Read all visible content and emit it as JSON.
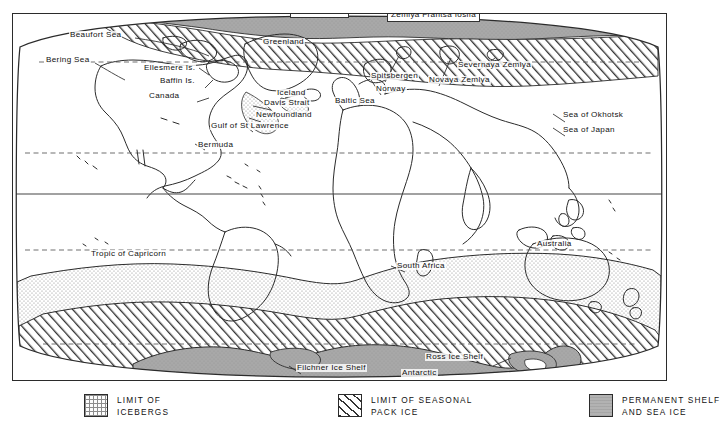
{
  "map": {
    "title": "World map of sea ice and iceberg limits",
    "projection": "oval",
    "colors": {
      "outline": "#2b2b2b",
      "permanent_ice": "#a8a8a8",
      "iceberg_stipple": "#e8e8e8",
      "pack_ice_hatch": "#ffffff",
      "graticule": "#555555"
    },
    "graticule": {
      "equator_label": "",
      "tropic_of_cancer": "",
      "tropic_of_capricorn": "Tropic of Capricorn",
      "arctic_circle": ""
    },
    "labels": [
      {
        "id": "arctic-ocean",
        "text": "Arctic Ocean",
        "x": 289,
        "y": 4,
        "style": "boxed"
      },
      {
        "id": "zemlya-frantsa-iosifa",
        "text": "Zemlya Frantsa Iosifa",
        "x": 386,
        "y": 8,
        "style": "boxed"
      },
      {
        "id": "beaufort-sea",
        "text": "Beaufort Sea",
        "x": 68,
        "y": 30,
        "style": "plain"
      },
      {
        "id": "greenland",
        "text": "Greenland",
        "x": 261,
        "y": 37,
        "style": "plain"
      },
      {
        "id": "bering-sea",
        "text": "Bering Sea",
        "x": 44,
        "y": 55,
        "style": "plain"
      },
      {
        "id": "ellesmere-is",
        "text": "Ellesmere Is.",
        "x": 142,
        "y": 63,
        "style": "plain"
      },
      {
        "id": "severnaya-zemlya",
        "text": "Severnaya Zemlya",
        "x": 456,
        "y": 60,
        "style": "plain"
      },
      {
        "id": "spitsbergen",
        "text": "Spitsbergen",
        "x": 369,
        "y": 71,
        "style": "plain"
      },
      {
        "id": "novaya-zemlya",
        "text": "Novaya Zemlya",
        "x": 427,
        "y": 75,
        "style": "plain"
      },
      {
        "id": "baffin-is",
        "text": "Baffin Is.",
        "x": 158,
        "y": 76,
        "style": "plain"
      },
      {
        "id": "norway",
        "text": "Norway",
        "x": 374,
        "y": 84,
        "style": "plain"
      },
      {
        "id": "iceland",
        "text": "Iceland",
        "x": 275,
        "y": 88,
        "style": "plain"
      },
      {
        "id": "canada",
        "text": "Canada",
        "x": 147,
        "y": 91,
        "style": "plain"
      },
      {
        "id": "davis-strait",
        "text": "Davis Strait",
        "x": 262,
        "y": 98,
        "style": "plain"
      },
      {
        "id": "baltic-sea",
        "text": "Baltic Sea",
        "x": 333,
        "y": 96,
        "style": "plain"
      },
      {
        "id": "newfoundland",
        "text": "Newfoundland",
        "x": 254,
        "y": 110,
        "style": "plain"
      },
      {
        "id": "sea-of-okhotsk",
        "text": "Sea of Okhotsk",
        "x": 561,
        "y": 110,
        "style": "plain"
      },
      {
        "id": "gulf-of-st-lawrence",
        "text": "Gulf of St Lawrence",
        "x": 209,
        "y": 121,
        "style": "plain"
      },
      {
        "id": "sea-of-japan",
        "text": "Sea of Japan",
        "x": 561,
        "y": 125,
        "style": "plain"
      },
      {
        "id": "bermuda",
        "text": "Bermuda",
        "x": 196,
        "y": 140,
        "style": "plain"
      },
      {
        "id": "australia",
        "text": "Australia",
        "x": 535,
        "y": 239,
        "style": "plain"
      },
      {
        "id": "tropic-of-capricorn",
        "text": "Tropic of Capricorn",
        "x": 89,
        "y": 249,
        "style": "plain"
      },
      {
        "id": "south-africa",
        "text": "South Africa",
        "x": 395,
        "y": 261,
        "style": "plain"
      },
      {
        "id": "filchner-ice-shelf",
        "text": "Filchner Ice Shelf",
        "x": 295,
        "y": 363,
        "style": "plain"
      },
      {
        "id": "ross-ice-shelf",
        "text": "Ross Ice Shelf",
        "x": 424,
        "y": 352,
        "style": "plain"
      },
      {
        "id": "antarctic",
        "text": "Antarctic",
        "x": 400,
        "y": 368,
        "style": "plain"
      }
    ]
  },
  "legend": {
    "items": [
      {
        "id": "icebergs",
        "swatch": "stipple",
        "line1": "LIMIT OF",
        "line2": "ICEBERGS",
        "x": 84
      },
      {
        "id": "pack-ice",
        "swatch": "hatch",
        "line1": "LIMIT OF SEASONAL",
        "line2": "PACK ICE",
        "x": 338
      },
      {
        "id": "permanent-ice",
        "swatch": "solid",
        "line1": "PERMANENT SHELF",
        "line2": "AND SEA ICE",
        "x": 589
      }
    ]
  }
}
